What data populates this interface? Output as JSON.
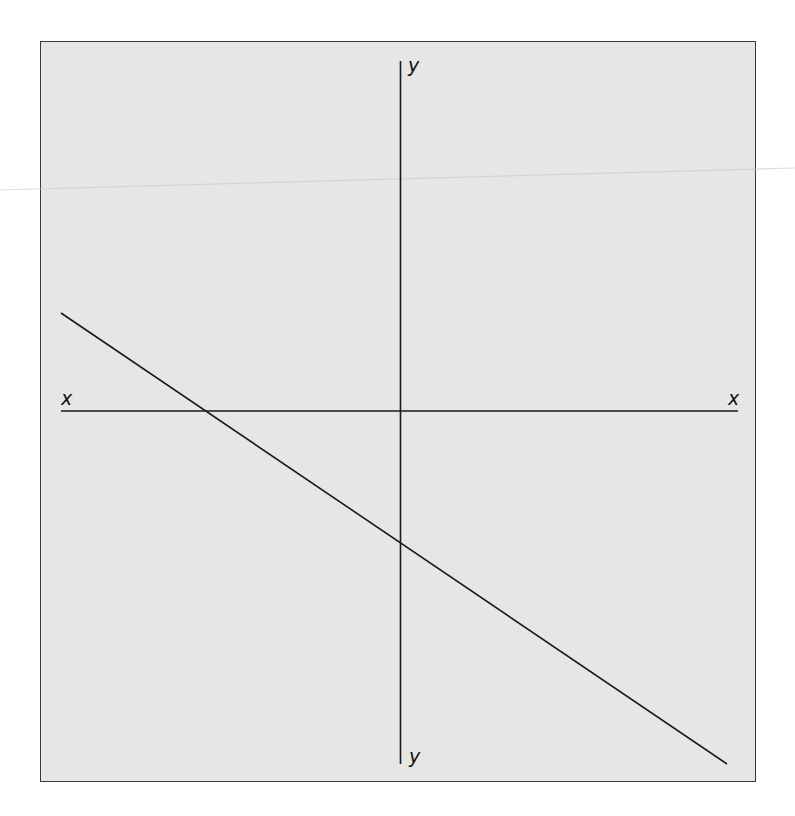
{
  "diagram": {
    "type": "coordinate-axes-with-line",
    "axes": {
      "x_label_left": "x",
      "x_label_right": "x",
      "y_label_top": "y",
      "y_label_bottom": "y"
    },
    "line": {
      "description": "straight line with negative slope crossing the negative x-axis and the negative y-axis",
      "slope_sign": "negative",
      "x_intercept_sign": "negative",
      "y_intercept_sign": "negative"
    },
    "colors": {
      "background": "#e6e6e6",
      "ink": "#1a1a1a",
      "border": "#3a3a3a"
    }
  }
}
